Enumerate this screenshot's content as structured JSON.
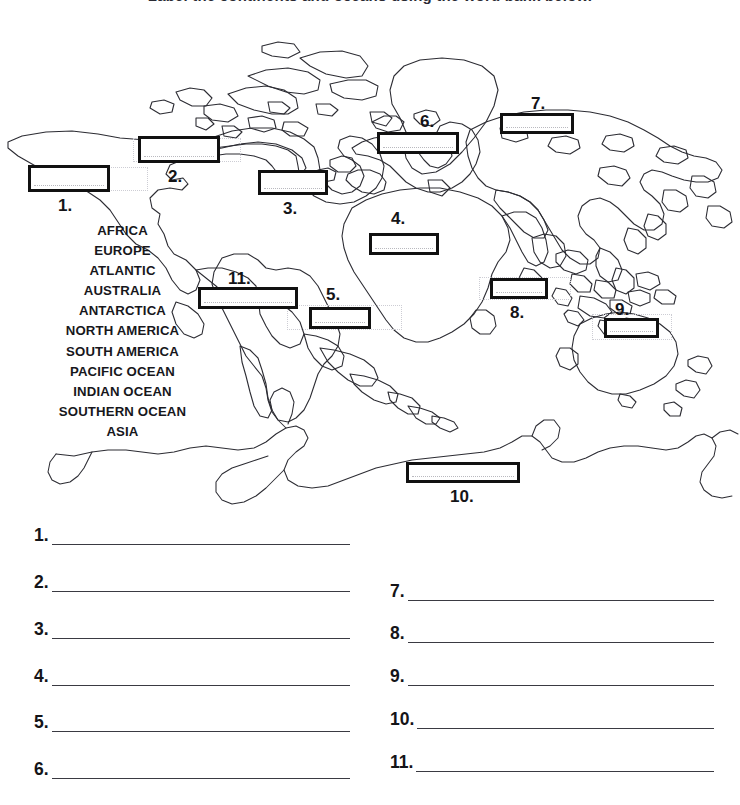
{
  "title": "Label the continents and oceans using the word bank below.",
  "word_bank": {
    "words": [
      "AFRICA",
      "EUROPE",
      "ATLANTIC",
      "AUSTRALIA",
      "ANTARCTICA",
      "NORTH AMERICA",
      "SOUTH AMERICA",
      "PACIFIC OCEAN",
      "INDIAN OCEAN",
      "SOUTHERN OCEAN",
      "ASIA"
    ]
  },
  "map": {
    "blanks": [
      {
        "label": "1.",
        "value": ""
      },
      {
        "label": "2.",
        "value": ""
      },
      {
        "label": "3.",
        "value": ""
      },
      {
        "label": "4.",
        "value": ""
      },
      {
        "label": "5.",
        "value": ""
      },
      {
        "label": "6.",
        "value": ""
      },
      {
        "label": "7.",
        "value": ""
      },
      {
        "label": "8.",
        "value": ""
      },
      {
        "label": "9.",
        "value": ""
      },
      {
        "label": "10.",
        "value": ""
      },
      {
        "label": "11.",
        "value": ""
      }
    ]
  },
  "answers": {
    "left_column": [
      {
        "label": "1.",
        "value": ""
      },
      {
        "label": "2.",
        "value": ""
      },
      {
        "label": "3.",
        "value": ""
      },
      {
        "label": "4.",
        "value": ""
      },
      {
        "label": "5.",
        "value": ""
      },
      {
        "label": "6.",
        "value": ""
      }
    ],
    "right_column": [
      {
        "label": "7.",
        "value": ""
      },
      {
        "label": "8.",
        "value": ""
      },
      {
        "label": "9.",
        "value": ""
      },
      {
        "label": "10.",
        "value": ""
      },
      {
        "label": "11.",
        "value": ""
      }
    ]
  },
  "colors": {
    "ink": "#1a1a1a",
    "coastline": "#2c2c33",
    "rule": "#3a3a42",
    "ghost": "#cdcdd4"
  }
}
